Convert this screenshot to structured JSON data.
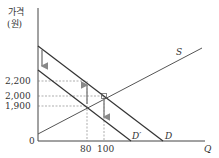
{
  "yaxis": {
    "label_line1": "가격",
    "label_line2": "(원)"
  },
  "xaxis": {
    "label": "Q",
    "origin": "0"
  },
  "y_ticks": [
    "2,200",
    "2,000",
    "1,900"
  ],
  "x_ticks": [
    "80",
    "100"
  ],
  "curves": {
    "supply": "S",
    "demand": "D",
    "demand_shifted": "D′"
  },
  "colors": {
    "line": "#333333",
    "dashed": "#777777",
    "arrow": "#888888"
  }
}
